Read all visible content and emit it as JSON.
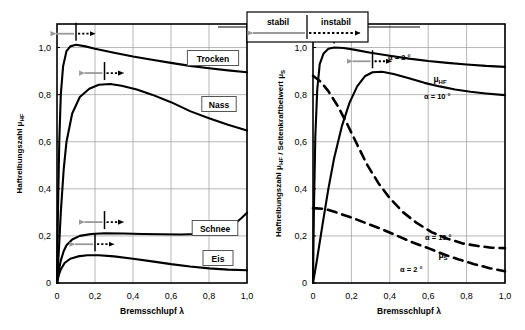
{
  "figure": {
    "title": "",
    "legend_box": {
      "stable_label": "stabil",
      "unstable_label": "instabil",
      "stable_arrow_icon": "left-arrow-gray-icon",
      "unstable_arrow_icon": "right-arrow-dotted-icon"
    }
  },
  "chart_data": [
    {
      "id": "left-panel",
      "type": "line",
      "title": "",
      "xlabel": "Bremsschlupf λ",
      "ylabel": "Haftreibungszahl μHF",
      "xlim": [
        0,
        1.0
      ],
      "ylim": [
        0,
        1.1
      ],
      "xticks": [
        0,
        0.2,
        0.4,
        0.6,
        0.8,
        1.0
      ],
      "xticklabels": [
        "0",
        "0,2",
        "0,4",
        "0,6",
        "0,8",
        "1,0"
      ],
      "yticks": [
        0,
        0.2,
        0.4,
        0.6,
        0.8,
        1.0
      ],
      "yticklabels": [
        "0",
        "0,2",
        "0,4",
        "0,6",
        "0,8",
        "1,0"
      ],
      "grid": true,
      "legend_position": "inline-boxed-labels",
      "series": [
        {
          "name": "Trocken",
          "style": "solid",
          "label_box": "Trocken",
          "peak": {
            "x": 0.1,
            "y": 1.01
          },
          "points": [
            [
              0.0,
              0.0
            ],
            [
              0.005,
              0.3
            ],
            [
              0.012,
              0.6
            ],
            [
              0.02,
              0.8
            ],
            [
              0.032,
              0.92
            ],
            [
              0.05,
              0.985
            ],
            [
              0.07,
              1.005
            ],
            [
              0.1,
              1.012
            ],
            [
              0.15,
              1.005
            ],
            [
              0.2,
              0.995
            ],
            [
              0.3,
              0.978
            ],
            [
              0.4,
              0.962
            ],
            [
              0.5,
              0.948
            ],
            [
              0.6,
              0.935
            ],
            [
              0.7,
              0.922
            ],
            [
              0.8,
              0.912
            ],
            [
              0.9,
              0.903
            ],
            [
              1.0,
              0.895
            ]
          ]
        },
        {
          "name": "Nass",
          "style": "solid",
          "label_box": "Nass",
          "peak": {
            "x": 0.25,
            "y": 0.845
          },
          "points": [
            [
              0.0,
              0.0
            ],
            [
              0.01,
              0.14
            ],
            [
              0.02,
              0.3
            ],
            [
              0.035,
              0.48
            ],
            [
              0.05,
              0.6
            ],
            [
              0.08,
              0.72
            ],
            [
              0.12,
              0.79
            ],
            [
              0.17,
              0.825
            ],
            [
              0.22,
              0.842
            ],
            [
              0.28,
              0.845
            ],
            [
              0.34,
              0.838
            ],
            [
              0.42,
              0.822
            ],
            [
              0.5,
              0.8
            ],
            [
              0.6,
              0.768
            ],
            [
              0.7,
              0.73
            ],
            [
              0.8,
              0.7
            ],
            [
              0.9,
              0.672
            ],
            [
              1.0,
              0.648
            ]
          ]
        },
        {
          "name": "Schnee",
          "style": "solid",
          "label_box": "Schnee",
          "peak": {
            "x": 0.25,
            "y": 0.212
          },
          "points": [
            [
              0.0,
              0.0
            ],
            [
              0.01,
              0.055
            ],
            [
              0.02,
              0.095
            ],
            [
              0.035,
              0.135
            ],
            [
              0.05,
              0.16
            ],
            [
              0.08,
              0.185
            ],
            [
              0.12,
              0.2
            ],
            [
              0.18,
              0.208
            ],
            [
              0.25,
              0.211
            ],
            [
              0.35,
              0.21
            ],
            [
              0.45,
              0.208
            ],
            [
              0.55,
              0.207
            ],
            [
              0.65,
              0.206
            ],
            [
              0.75,
              0.208
            ],
            [
              0.82,
              0.212
            ],
            [
              0.88,
              0.225
            ],
            [
              0.93,
              0.248
            ],
            [
              0.97,
              0.275
            ],
            [
              1.0,
              0.298
            ]
          ]
        },
        {
          "name": "Eis",
          "style": "solid",
          "label_box": "Eis",
          "peak": {
            "x": 0.2,
            "y": 0.118
          },
          "points": [
            [
              0.0,
              0.0
            ],
            [
              0.01,
              0.035
            ],
            [
              0.02,
              0.058
            ],
            [
              0.04,
              0.085
            ],
            [
              0.07,
              0.103
            ],
            [
              0.11,
              0.113
            ],
            [
              0.16,
              0.118
            ],
            [
              0.22,
              0.118
            ],
            [
              0.3,
              0.113
            ],
            [
              0.4,
              0.103
            ],
            [
              0.5,
              0.092
            ],
            [
              0.6,
              0.08
            ],
            [
              0.7,
              0.07
            ],
            [
              0.8,
              0.062
            ],
            [
              0.9,
              0.057
            ],
            [
              1.0,
              0.054
            ]
          ]
        }
      ],
      "stability_markers": [
        {
          "series": "Trocken",
          "x": 0.1,
          "y": 1.012
        },
        {
          "series": "Nass",
          "x": 0.25,
          "y": 0.845
        },
        {
          "series": "Schnee",
          "x": 0.25,
          "y": 0.212
        },
        {
          "series": "Eis",
          "x": 0.2,
          "y": 0.118
        }
      ]
    },
    {
      "id": "right-panel",
      "type": "line",
      "title": "",
      "xlabel": "Bremsschlupf λ",
      "ylabel": "Haftreibungszahl μHF / Seitenkraftbeiwert μS",
      "xlim": [
        0,
        1.0
      ],
      "ylim": [
        0,
        1.1
      ],
      "xticks": [
        0,
        0.2,
        0.4,
        0.6,
        0.8,
        1.0
      ],
      "xticklabels": [
        "0",
        "0,2",
        "0,4",
        "0,6",
        "0,8",
        "1,0"
      ],
      "yticks": [
        0,
        0.2,
        0.4,
        0.6,
        0.8,
        1.0
      ],
      "yticklabels": [
        "0",
        "0,2",
        "0,4",
        "0,6",
        "0,8",
        "1,0"
      ],
      "grid": true,
      "legend_position": "inline-labels",
      "series": [
        {
          "name": "μHF, α = 2 °",
          "style": "solid",
          "label": "α = 2 °",
          "quantity_label": "μHF",
          "peak": {
            "x": 0.11,
            "y": 1.0
          },
          "points": [
            [
              0.0,
              0.0
            ],
            [
              0.005,
              0.32
            ],
            [
              0.012,
              0.62
            ],
            [
              0.022,
              0.82
            ],
            [
              0.035,
              0.93
            ],
            [
              0.055,
              0.975
            ],
            [
              0.08,
              0.995
            ],
            [
              0.11,
              1.0
            ],
            [
              0.16,
              0.998
            ],
            [
              0.22,
              0.99
            ],
            [
              0.3,
              0.978
            ],
            [
              0.4,
              0.965
            ],
            [
              0.5,
              0.953
            ],
            [
              0.6,
              0.943
            ],
            [
              0.7,
              0.935
            ],
            [
              0.8,
              0.928
            ],
            [
              0.9,
              0.922
            ],
            [
              1.0,
              0.918
            ]
          ]
        },
        {
          "name": "μHF, α = 10 °",
          "style": "solid",
          "label": "α = 10 °",
          "peak": {
            "x": 0.3,
            "y": 0.895
          },
          "points": [
            [
              0.0,
              0.0
            ],
            [
              0.02,
              0.095
            ],
            [
              0.05,
              0.25
            ],
            [
              0.08,
              0.4
            ],
            [
              0.11,
              0.53
            ],
            [
              0.15,
              0.665
            ],
            [
              0.19,
              0.765
            ],
            [
              0.23,
              0.835
            ],
            [
              0.27,
              0.878
            ],
            [
              0.31,
              0.895
            ],
            [
              0.36,
              0.897
            ],
            [
              0.42,
              0.888
            ],
            [
              0.5,
              0.87
            ],
            [
              0.58,
              0.85
            ],
            [
              0.66,
              0.835
            ],
            [
              0.74,
              0.822
            ],
            [
              0.82,
              0.812
            ],
            [
              0.9,
              0.805
            ],
            [
              1.0,
              0.798
            ]
          ]
        },
        {
          "name": "μS, α = 10 °",
          "style": "dashed",
          "label": "α = 10 °",
          "quantity_label": "μS",
          "points": [
            [
              0.0,
              0.88
            ],
            [
              0.04,
              0.855
            ],
            [
              0.08,
              0.815
            ],
            [
              0.13,
              0.75
            ],
            [
              0.18,
              0.672
            ],
            [
              0.23,
              0.588
            ],
            [
              0.28,
              0.505
            ],
            [
              0.34,
              0.425
            ],
            [
              0.4,
              0.36
            ],
            [
              0.47,
              0.3
            ],
            [
              0.54,
              0.255
            ],
            [
              0.62,
              0.215
            ],
            [
              0.7,
              0.188
            ],
            [
              0.78,
              0.168
            ],
            [
              0.86,
              0.157
            ],
            [
              0.93,
              0.15
            ],
            [
              1.0,
              0.148
            ]
          ]
        },
        {
          "name": "μS, α = 2 °",
          "style": "dashed",
          "label": "α = 2 °",
          "points": [
            [
              0.0,
              0.318
            ],
            [
              0.06,
              0.315
            ],
            [
              0.12,
              0.3
            ],
            [
              0.2,
              0.278
            ],
            [
              0.28,
              0.253
            ],
            [
              0.36,
              0.228
            ],
            [
              0.44,
              0.2
            ],
            [
              0.52,
              0.172
            ],
            [
              0.6,
              0.148
            ],
            [
              0.68,
              0.122
            ],
            [
              0.76,
              0.1
            ],
            [
              0.84,
              0.08
            ],
            [
              0.92,
              0.063
            ],
            [
              1.0,
              0.05
            ]
          ]
        }
      ],
      "stability_markers": [
        {
          "series": "μHF, α = 2 °",
          "x": 0.11,
          "y": 1.0
        },
        {
          "series": "μHF, α = 10 °",
          "x": 0.31,
          "y": 0.895
        }
      ]
    }
  ],
  "colors": {
    "curve": "#000000",
    "grid": "#9a9a9a",
    "axis": "#000000",
    "stable_arrow": "#9a9a9a",
    "unstable_arrow": "#000000",
    "label_box_border": "#555555",
    "label_box_fill": "#ffffff"
  }
}
